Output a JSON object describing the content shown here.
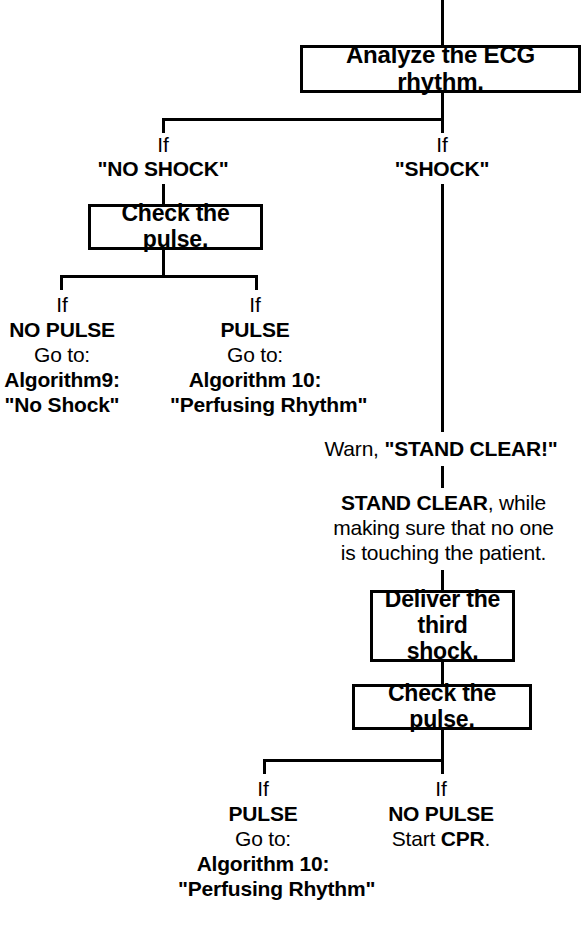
{
  "diagram": {
    "colors": {
      "ink": "#000000",
      "paper": "#ffffff"
    },
    "nodes": {
      "analyze_ecg": "Analyze the ECG rhythm.",
      "check_pulse_left": "Check the pulse.",
      "deliver_third_shock_line1": "Deliver the",
      "deliver_third_shock_line2": "third shock.",
      "check_pulse_bottom": "Check the pulse."
    },
    "branches": {
      "no_shock": {
        "if": "If",
        "condition": "\"NO SHOCK\""
      },
      "shock": {
        "if": "If",
        "condition": "\"SHOCK\""
      },
      "no_pulse_left": {
        "if": "If",
        "state": "NO PULSE",
        "goto": "Go to:",
        "algorithm": "Algorithm9:",
        "algorithm_name": "\"No Shock\""
      },
      "pulse_left": {
        "if": "If",
        "state": "PULSE",
        "goto": "Go to:",
        "algorithm": "Algorithm 10:",
        "algorithm_name": "\"Perfusing Rhythm\""
      },
      "pulse_bottom": {
        "if": "If",
        "state": "PULSE",
        "goto": "Go to:",
        "algorithm": "Algorithm 10:",
        "algorithm_name": "\"Perfusing Rhythm\""
      },
      "no_pulse_bottom": {
        "if": "If",
        "state": "NO PULSE",
        "action_prefix": "Start ",
        "action_strong": "CPR",
        "action_suffix": "."
      }
    },
    "instructions": {
      "warn_prefix": "Warn, ",
      "warn_strong": "\"STAND CLEAR!\"",
      "stand_clear_strong": "STAND CLEAR",
      "stand_clear_rest": ", while",
      "stand_clear_line2": "making sure that no one",
      "stand_clear_line3": "is touching the patient."
    }
  }
}
